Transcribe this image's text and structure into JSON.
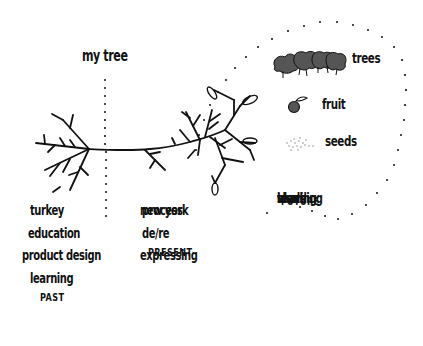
{
  "diagram": {
    "title": "my tree",
    "legend": {
      "items": [
        {
          "icon": "trees-icon",
          "label": "trees"
        },
        {
          "icon": "fruit-icon",
          "label": "fruit"
        },
        {
          "icon": "seeds-icon",
          "label": "seeds"
        }
      ]
    },
    "columns": [
      {
        "name": "past",
        "items": [
          "turkey",
          "education",
          "product design",
          "learning"
        ],
        "label": "PAST"
      },
      {
        "name": "present",
        "items": [
          "new york",
          "process",
          "de/re",
          "expressing"
        ],
        "label": "PRESENT"
      },
      {
        "name": "future",
        "items": [
          "world",
          "teaching",
          "ideas",
          "sharing"
        ],
        "label": "FUTURE"
      }
    ],
    "colors": {
      "ink": "#111111",
      "tree_fill": "#555555",
      "background": "#ffffff"
    }
  }
}
